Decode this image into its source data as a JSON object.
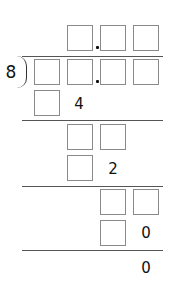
{
  "divisor": "8",
  "quotient_row": {
    "boxes": 3,
    "decimal_after_box": 1
  },
  "dividend_row": {
    "boxes": 4,
    "decimal_after_box": 2
  },
  "steps": [
    {
      "boxes": 1,
      "given_digit": "4"
    },
    {
      "boxes": 2
    },
    {
      "boxes": 1,
      "given_digit": "2"
    },
    {
      "boxes": 2
    },
    {
      "boxes": 1,
      "given_digit": "0"
    }
  ],
  "remainder": "0"
}
